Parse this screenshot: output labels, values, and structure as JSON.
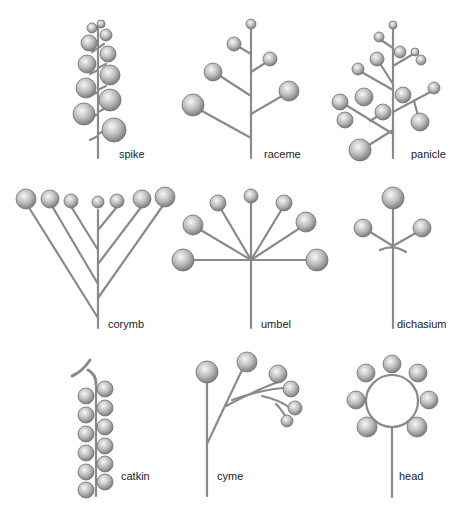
{
  "colors": {
    "stem": "#8a8a8a",
    "flower_light": "#f2f2f2",
    "flower_dark": "#8c8c8c",
    "flower_edge": "#6e6e6e",
    "background": "#ffffff"
  },
  "panels": [
    {
      "id": "spike",
      "label": "spike"
    },
    {
      "id": "raceme",
      "label": "raceme"
    },
    {
      "id": "panicle",
      "label": "panicle"
    },
    {
      "id": "corymb",
      "label": "corymb"
    },
    {
      "id": "umbel",
      "label": "umbel"
    },
    {
      "id": "dichasium",
      "label": "dichasium"
    },
    {
      "id": "catkin",
      "label": "catkin"
    },
    {
      "id": "cyme",
      "label": "cyme"
    },
    {
      "id": "head",
      "label": "head"
    }
  ]
}
